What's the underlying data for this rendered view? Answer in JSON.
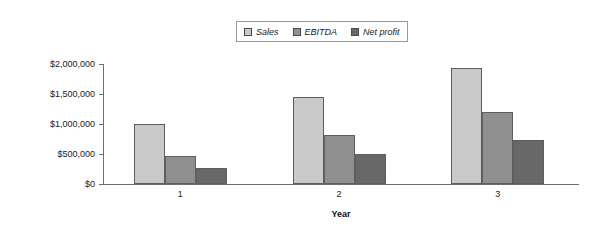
{
  "chart_data": {
    "type": "bar",
    "title": "",
    "subtitle": "",
    "xlabel": "Year",
    "ylabel": "",
    "categories": [
      "1",
      "2",
      "3"
    ],
    "series": [
      {
        "name": "Sales",
        "values": [
          1000000,
          1450000,
          1940000
        ],
        "color": "#c9c9c9"
      },
      {
        "name": "EBITDA",
        "values": [
          470000,
          810000,
          1200000
        ],
        "color": "#8f8f8f"
      },
      {
        "name": "Net profit",
        "values": [
          265000,
          500000,
          740000
        ],
        "color": "#686868"
      }
    ],
    "ylim": [
      0,
      2000000
    ],
    "ytick_values": [
      0,
      500000,
      1000000,
      1500000,
      2000000
    ],
    "ytick_labels": [
      "$0",
      "$500,000",
      "$1,000,000",
      "$1,500,000",
      "$2,000,000"
    ],
    "grid": false,
    "legend_position": "top-center",
    "axis_color": "#6e6e6e",
    "bar_border_color": "#5e5e5e",
    "background": "#ffffff"
  },
  "legend": {
    "entries": [
      {
        "label": "Sales"
      },
      {
        "label": "EBITDA"
      },
      {
        "label": "Net profit"
      }
    ]
  },
  "axes": {
    "x_title": "Year"
  }
}
